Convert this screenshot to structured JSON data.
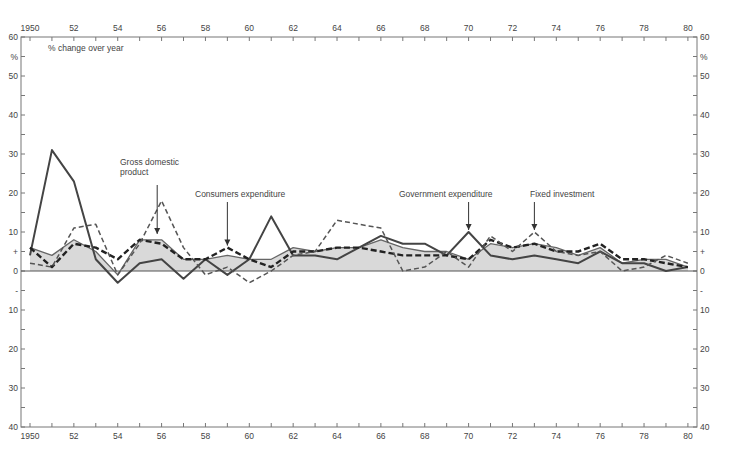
{
  "chart_data": {
    "type": "line",
    "title": "% change over year",
    "ylabel": "%",
    "xlabel": "",
    "x": [
      1950,
      1951,
      1952,
      1953,
      1954,
      1955,
      1956,
      1957,
      1958,
      1959,
      1960,
      1961,
      1962,
      1963,
      1964,
      1965,
      1966,
      1967,
      1968,
      1969,
      1970,
      1971,
      1972,
      1973,
      1974,
      1975,
      1976,
      1977,
      1978,
      1979,
      1980
    ],
    "x_tick_labels": [
      "1950",
      "52",
      "54",
      "56",
      "58",
      "60",
      "62",
      "64",
      "66",
      "68",
      "70",
      "72",
      "74",
      "76",
      "78",
      "80"
    ],
    "y_tick_labels_up": [
      "60",
      "%",
      "50",
      "40",
      "30",
      "20",
      "10",
      "+",
      "0"
    ],
    "y_tick_labels_down": [
      "-",
      "10",
      "20",
      "30",
      "40"
    ],
    "ylim": [
      -40,
      60
    ],
    "grid": false,
    "series": [
      {
        "name": "Gross domestic product",
        "style": "solid-thin-shaded",
        "values": [
          6,
          4,
          8,
          5,
          -1,
          8,
          8,
          3,
          3,
          4,
          3,
          3,
          6,
          5,
          6,
          6,
          8,
          6,
          5,
          5,
          3,
          7,
          6,
          7,
          6,
          4,
          6,
          2,
          3,
          3,
          1
        ]
      },
      {
        "name": "Government expenditure",
        "style": "solid-bold",
        "values": [
          4,
          31,
          23,
          3,
          -3,
          2,
          3,
          -2,
          3,
          -1,
          3,
          14,
          4,
          4,
          3,
          6,
          9,
          7,
          7,
          4,
          10,
          4,
          3,
          4,
          3,
          2,
          5,
          2,
          2,
          0,
          1
        ]
      },
      {
        "name": "Consumers expenditure",
        "style": "dashed-bold",
        "values": [
          6,
          1,
          7,
          6,
          3,
          8,
          7,
          3,
          3,
          6,
          3,
          1,
          5,
          5,
          6,
          6,
          5,
          4,
          4,
          4,
          3,
          8,
          6,
          7,
          5,
          5,
          7,
          3,
          3,
          2,
          1
        ]
      },
      {
        "name": "Fixed investment",
        "style": "dashed-thin",
        "values": [
          2,
          1,
          11,
          12,
          -1,
          7,
          18,
          6,
          -1,
          1,
          -3,
          0,
          4,
          5,
          13,
          12,
          11,
          0,
          1,
          5,
          1,
          9,
          5,
          10,
          5,
          4,
          5,
          0,
          1,
          4,
          2
        ]
      }
    ],
    "annotations": [
      {
        "text_lines": [
          "Gross domestic",
          "product"
        ],
        "arrow_year": 1955.8
      },
      {
        "text_lines": [
          "Consumers expenditure"
        ],
        "arrow_year": 1959
      },
      {
        "text_lines": [
          "Government expenditure"
        ],
        "arrow_year": 1970
      },
      {
        "text_lines": [
          "Fixed investment"
        ],
        "arrow_year": 1973
      }
    ]
  }
}
